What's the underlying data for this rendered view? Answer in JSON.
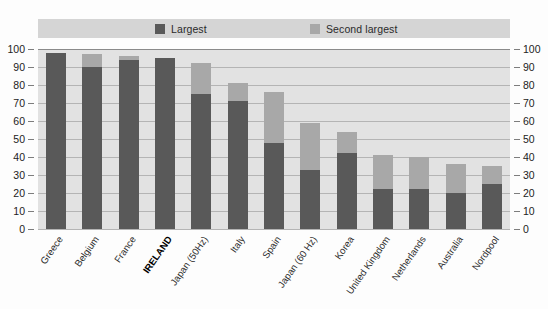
{
  "legend": {
    "entries": [
      {
        "label": "Largest",
        "color": "#595959",
        "name": "largest"
      },
      {
        "label": "Second largest",
        "color": "#a8a8a8",
        "name": "second-largest"
      }
    ]
  },
  "axis": {
    "ticks": [
      "100",
      "90",
      "80",
      "70",
      "60",
      "50",
      "40",
      "30",
      "20",
      "10",
      "0"
    ],
    "min": 0,
    "max": 100,
    "step": 10
  },
  "colors": {
    "largest": "#595959",
    "second_largest": "#a8a8a8",
    "plot_background": "#e2e2e2",
    "legend_background": "#d5d5d5",
    "gridline": "#b4b4b4",
    "axis_line": "#8a8a8a"
  },
  "chart_data": {
    "type": "bar",
    "stacked": true,
    "title": "",
    "subtitle": "",
    "xlabel": "",
    "ylabel": "",
    "ylim": [
      0,
      100
    ],
    "yticks": [
      0,
      10,
      20,
      30,
      40,
      50,
      60,
      70,
      80,
      90,
      100
    ],
    "grid": true,
    "legend_position": "top",
    "dual_y_axis": true,
    "categories": [
      "Greece",
      "Belgium",
      "France",
      "IRELAND",
      "Japan (50Hz)",
      "Italy",
      "Spain",
      "Japan (60 Hz)",
      "Korea",
      "United Kingdom",
      "Netherlands",
      "Australia",
      "Nordpool"
    ],
    "highlighted_category": "IRELAND",
    "series": [
      {
        "name": "Largest",
        "color": "#595959",
        "values": [
          98,
          90,
          94,
          95,
          75,
          71,
          48,
          33,
          42,
          22,
          22,
          20,
          25
        ]
      },
      {
        "name": "Second largest",
        "color": "#a8a8a8",
        "values": [
          0,
          7,
          2,
          0,
          17,
          10,
          28,
          26,
          12,
          19,
          18,
          16,
          10
        ]
      }
    ],
    "totals": [
      98,
      97,
      96,
      95,
      92,
      81,
      76,
      59,
      54,
      41,
      40,
      36,
      35
    ]
  }
}
